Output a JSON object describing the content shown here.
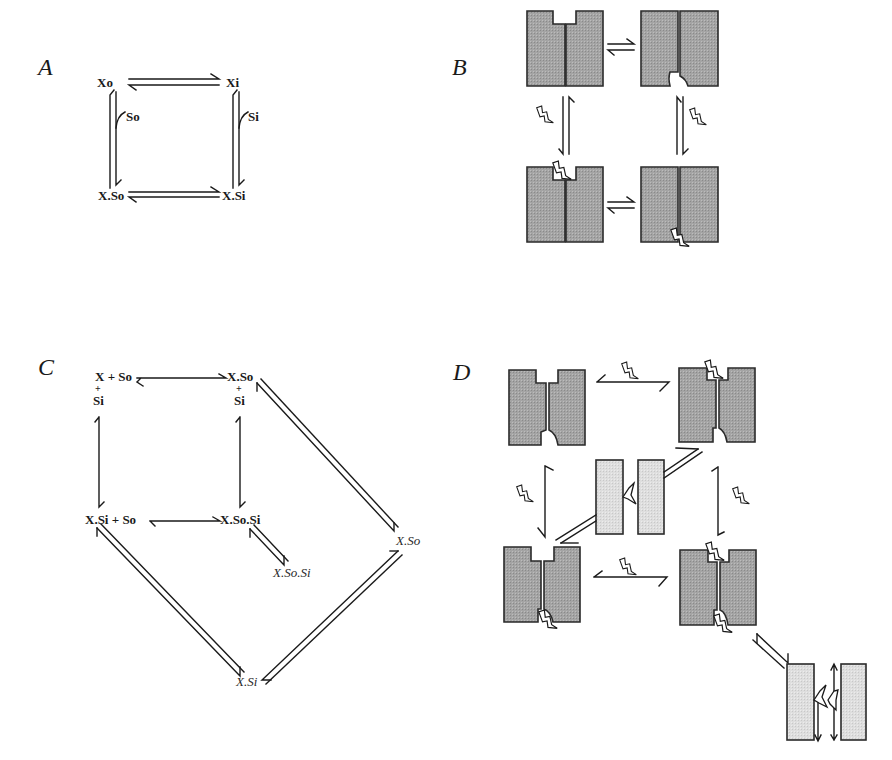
{
  "figure": {
    "panels": [
      {
        "id": "A",
        "label": "A",
        "type": "kinetic-scheme"
      },
      {
        "id": "B",
        "label": "B",
        "type": "cartoon-scheme"
      },
      {
        "id": "C",
        "label": "C",
        "type": "kinetic-scheme"
      },
      {
        "id": "D",
        "label": "D",
        "type": "cartoon-scheme"
      }
    ],
    "panelA": {
      "states": [
        "Xo",
        "Xi",
        "X.So",
        "X.Si"
      ],
      "substrate_labels": [
        "So",
        "Si"
      ],
      "transitions": [
        {
          "from": "Xo",
          "to": "Xi",
          "type": "reversible"
        },
        {
          "from": "Xo",
          "to": "X.So",
          "type": "reversible",
          "binding": "So"
        },
        {
          "from": "Xi",
          "to": "X.Si",
          "type": "reversible",
          "binding": "Si"
        },
        {
          "from": "X.So",
          "to": "X.Si",
          "type": "reversible"
        }
      ]
    },
    "panelB": {
      "description": "Alternating access transporter cartoon: outward-open, inward-open, substrate-bound outward, substrate-bound inward",
      "states": [
        "outward-open",
        "inward-open",
        "outward-bound",
        "inward-bound"
      ],
      "transitions": [
        {
          "from": "outward-open",
          "to": "inward-open",
          "type": "reversible"
        },
        {
          "from": "outward-open",
          "to": "outward-bound",
          "type": "reversible",
          "binding": "substrate"
        },
        {
          "from": "inward-open",
          "to": "inward-bound",
          "type": "reversible",
          "binding": "substrate"
        },
        {
          "from": "outward-bound",
          "to": "inward-bound",
          "type": "reversible"
        }
      ]
    },
    "panelC": {
      "states": {
        "top_left": {
          "line1": "X + So",
          "plus": "+",
          "line2": "Si"
        },
        "top_right": {
          "line1": "X.So",
          "plus": "+",
          "line2": "Si"
        },
        "bottom_left": {
          "line1": "X.Si + So"
        },
        "bottom_right": {
          "line1": "X.So.Si"
        },
        "inactive_XSo": "X.So",
        "inactive_XSoSi": "X.So.Si",
        "inactive_XSi": "X.Si"
      },
      "transitions": [
        {
          "from": "X + So + Si",
          "to": "X.So + Si",
          "type": "reversible"
        },
        {
          "from": "X + So + Si",
          "to": "X.Si + So",
          "type": "reversible"
        },
        {
          "from": "X.So + Si",
          "to": "X.So.Si",
          "type": "reversible"
        },
        {
          "from": "X.Si + So",
          "to": "X.So.Si",
          "type": "reversible"
        },
        {
          "from": "X.So + Si",
          "to": "X.So (italic)",
          "type": "reversible-double"
        },
        {
          "from": "X.So.Si",
          "to": "X.So.Si (italic)",
          "type": "reversible-double"
        },
        {
          "from": "X.Si + So",
          "to": "X.Si (italic)",
          "type": "reversible-double"
        },
        {
          "from": "X.So (italic)",
          "to": "X.Si (italic)",
          "type": "reversible-double"
        }
      ]
    },
    "panelD": {
      "description": "Channel-like transporter cartoon with central open-pore intermediate and dissociated subunit state",
      "states": [
        "empty-gated",
        "outer-bound",
        "open-pore",
        "inner-bound",
        "dual-bound",
        "dissociated"
      ],
      "transitions": [
        {
          "from": "empty-gated",
          "to": "outer-bound",
          "type": "reversible",
          "binding": "substrate"
        },
        {
          "from": "empty-gated",
          "to": "inner-bound",
          "type": "reversible",
          "binding": "substrate"
        },
        {
          "from": "outer-bound",
          "to": "dual-bound",
          "type": "reversible",
          "binding": "substrate"
        },
        {
          "from": "inner-bound",
          "to": "dual-bound",
          "type": "reversible",
          "binding": "substrate"
        },
        {
          "from": "outer-bound",
          "to": "open-pore",
          "type": "reversible-double"
        },
        {
          "from": "inner-bound",
          "to": "open-pore",
          "type": "reversible-double"
        },
        {
          "from": "dual-bound",
          "to": "dissociated",
          "type": "reversible-double"
        }
      ]
    },
    "colors": {
      "ink": "#1a1a1a",
      "dark_fill": "#a8a8a8",
      "light_fill": "#dcdcdc",
      "background": "#ffffff"
    }
  }
}
